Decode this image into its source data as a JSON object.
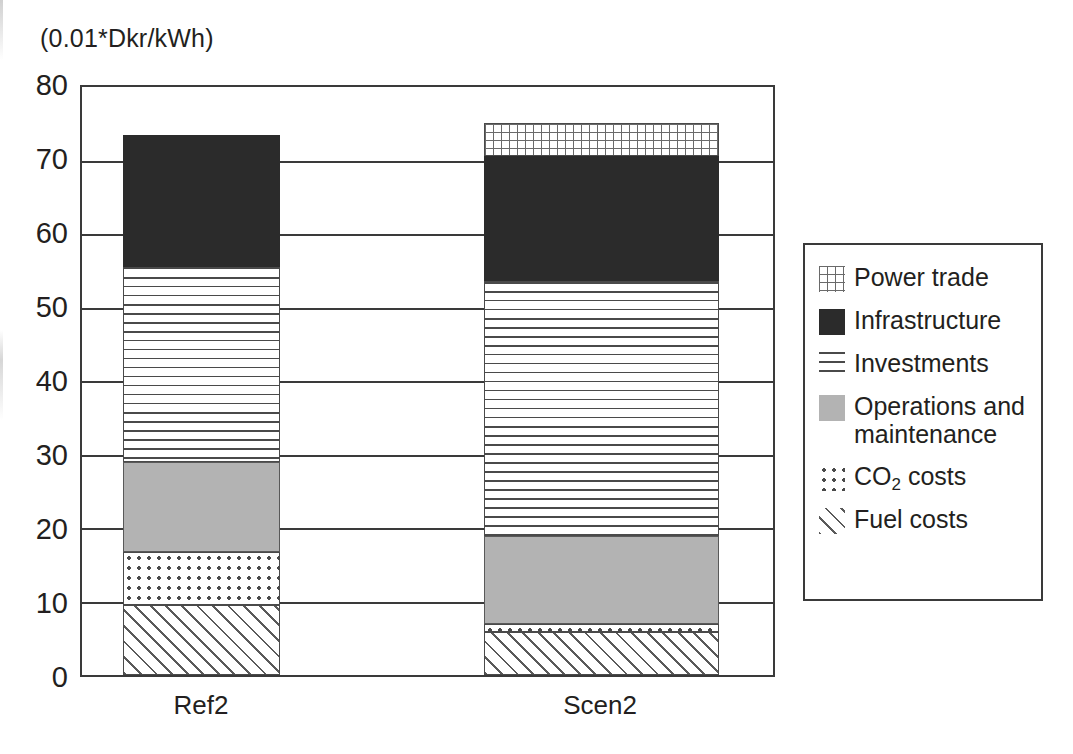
{
  "chart_data": {
    "type": "bar",
    "stacked": true,
    "title": "",
    "subtitle": "",
    "unit_caption": "(0.01*Dkr/kWh)",
    "xlabel": "",
    "ylabel": "",
    "ylim": [
      0,
      80
    ],
    "yticks": [
      80,
      70,
      60,
      50,
      40,
      30,
      20,
      10,
      0
    ],
    "ytick_labels": [
      "80",
      "70",
      "60",
      "50",
      "40",
      "30",
      "20",
      "10",
      "0"
    ],
    "grid": true,
    "grid_axis": "y",
    "legend_position": "right",
    "categories": [
      "Ref2",
      "Scen2"
    ],
    "series": [
      {
        "name": "Fuel costs",
        "pattern": "diagonal-hatch",
        "values": [
          9.5,
          5.8
        ]
      },
      {
        "name": "CO2 costs",
        "label": "CO₂ costs",
        "pattern": "dots",
        "values": [
          7.3,
          1.2
        ]
      },
      {
        "name": "Operations and maintenance",
        "pattern": "solid-gray",
        "color": "#b3b3b3",
        "values": [
          12.2,
          11.9
        ]
      },
      {
        "name": "Investments",
        "pattern": "horizontal-lines",
        "values": [
          26.5,
          34.7
        ]
      },
      {
        "name": "Infrastructure",
        "pattern": "solid-black",
        "color": "#2b2b2b",
        "values": [
          18.0,
          17.0
        ]
      },
      {
        "name": "Power trade",
        "pattern": "fine-grid",
        "values": [
          0,
          4.5
        ]
      }
    ],
    "cumulative_tops": {
      "Ref2": [
        9.5,
        16.8,
        29.0,
        55.5,
        73.5,
        73.5
      ],
      "Scen2": [
        5.8,
        7.0,
        18.9,
        53.6,
        70.6,
        75.1
      ]
    },
    "totals": [
      73.5,
      75.1
    ]
  },
  "legend": {
    "items": [
      {
        "label": "Power trade",
        "pattern": "fine-grid"
      },
      {
        "label": "Infrastructure",
        "pattern": "solid-black"
      },
      {
        "label": "Investments",
        "pattern": "horizontal-lines"
      },
      {
        "label": "Operations and\nmaintenance",
        "pattern": "solid-gray"
      },
      {
        "label": "CO2 costs",
        "pattern": "dots"
      },
      {
        "label": "Fuel costs",
        "pattern": "diagonal-hatch"
      }
    ]
  },
  "colors": {
    "axis": "#3a3a3a",
    "text": "#231f20",
    "infrastructure": "#2b2b2b",
    "operations": "#b3b3b3",
    "background": "#ffffff"
  }
}
